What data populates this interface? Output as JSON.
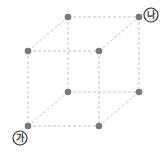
{
  "diagram": {
    "type": "cube-wireframe",
    "colors": {
      "edge": "#c4c4c4",
      "vertex": "#7a7a7a",
      "label": "#333333"
    },
    "vertices": [
      {
        "id": "back-top-left",
        "x": 68,
        "y": 17
      },
      {
        "id": "back-top-right",
        "x": 139,
        "y": 17
      },
      {
        "id": "front-top-left",
        "x": 28,
        "y": 51
      },
      {
        "id": "front-top-right",
        "x": 99,
        "y": 51
      },
      {
        "id": "back-bottom-left",
        "x": 68,
        "y": 92
      },
      {
        "id": "back-bottom-right",
        "x": 139,
        "y": 92
      },
      {
        "id": "front-bottom-left",
        "x": 28,
        "y": 126
      },
      {
        "id": "front-bottom-right",
        "x": 99,
        "y": 126
      }
    ],
    "labels": {
      "start": {
        "text": "가",
        "x": 20,
        "y": 138
      },
      "end": {
        "text": "나",
        "x": 151,
        "y": 15
      }
    }
  }
}
